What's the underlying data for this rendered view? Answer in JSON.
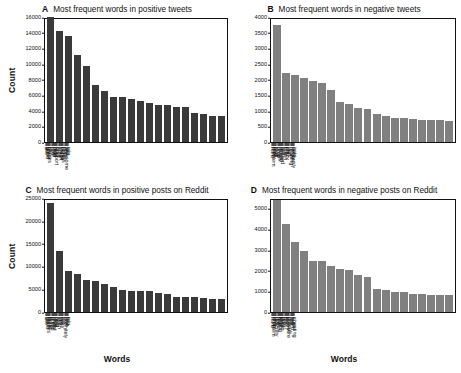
{
  "figure": {
    "background": "#ffffff",
    "dark_bar_color": "#3a3a3a",
    "light_bar_color": "#808080",
    "axis_color": "#111111"
  },
  "chart_data": [
    {
      "id": "A",
      "letter": "A",
      "type": "bar",
      "title": "Most frequent words in positive tweets",
      "xlabel": "",
      "ylabel": "Count",
      "ylim": [
        0,
        16000
      ],
      "yticks": [
        0,
        2000,
        4000,
        6000,
        8000,
        10000,
        12000,
        14000,
        16000
      ],
      "ytick_labels": [
        "0",
        "2000",
        "4000",
        "6000",
        "8000",
        "10000",
        "12000",
        "14000",
        "16000"
      ],
      "grid": false,
      "legend": "none",
      "bar_color": "#3a3a3a",
      "categories": [
        "like",
        "good",
        "great",
        "thanks",
        "join",
        "fun",
        "love",
        "help",
        "nice",
        "support",
        "best",
        "sure",
        "smart",
        "thank",
        "better",
        "fitness",
        "hope",
        "awesome",
        "yes",
        "win"
      ],
      "values": [
        16300,
        14400,
        13800,
        11300,
        9950,
        7450,
        6600,
        5900,
        5800,
        5600,
        5300,
        5100,
        4850,
        4800,
        4550,
        4500,
        3750,
        3700,
        3400,
        3350
      ]
    },
    {
      "id": "B",
      "letter": "B",
      "type": "bar",
      "title": "Most frequent words in negative tweets",
      "xlabel": "",
      "ylabel": "",
      "ylim": [
        0,
        4000
      ],
      "yticks": [
        0,
        500,
        1000,
        1500,
        2000,
        2500,
        3000,
        3500,
        4000
      ],
      "ytick_labels": [
        "0",
        "500",
        "1000",
        "1500",
        "2000",
        "2500",
        "3000",
        "3500",
        "4000"
      ],
      "grid": false,
      "legend": "none",
      "bar_color": "#808080",
      "categories": [
        "hard",
        "problem",
        "pain",
        "bad",
        "stop",
        "drop",
        "tough",
        "miss",
        "wrong",
        "missed",
        "lost",
        "crash",
        "pay",
        "crazy",
        "low",
        "hurt",
        "missing",
        "forget",
        "seriously",
        "hate"
      ],
      "values": [
        3820,
        2250,
        2170,
        2075,
        1990,
        1935,
        1690,
        1310,
        1240,
        1120,
        1060,
        910,
        830,
        790,
        765,
        760,
        720,
        710,
        700,
        695
      ]
    },
    {
      "id": "C",
      "letter": "C",
      "type": "bar",
      "title": "Most frequent words in positive posts on Reddit",
      "xlabel": "Words",
      "ylabel": "Count",
      "ylim": [
        0,
        25000
      ],
      "yticks": [
        0,
        5000,
        10000,
        15000,
        20000,
        25000
      ],
      "ytick_labels": [
        "0",
        "5000",
        "10000",
        "15000",
        "20000",
        "25000"
      ],
      "grid": false,
      "legend": "none",
      "bar_color": "#3a3a3a",
      "categories": [
        "like",
        "good",
        "thanks",
        "sure",
        "better",
        "great",
        "pretty",
        "smart",
        "nice",
        "best",
        "help",
        "yeah",
        "fan",
        "yes",
        "easy",
        "fun",
        "definitely",
        "love",
        "free",
        "win"
      ],
      "values": [
        24300,
        13550,
        9100,
        8400,
        7250,
        6900,
        6300,
        5650,
        4950,
        4750,
        4700,
        4600,
        4200,
        4050,
        3450,
        3400,
        3400,
        3100,
        3000,
        2980
      ]
    },
    {
      "id": "D",
      "letter": "D",
      "type": "bar",
      "title": "Most frequent words in negative posts on Reddit",
      "xlabel": "Words",
      "ylabel": "",
      "ylim": [
        0,
        5500
      ],
      "yticks": [
        0,
        1000,
        2000,
        3000,
        4000,
        5000
      ],
      "ytick_labels": [
        "0",
        "1000",
        "2000",
        "3000",
        "4000",
        "5000"
      ],
      "grid": false,
      "legend": "none",
      "bar_color": "#808080",
      "categories": [
        "hard",
        "problem",
        "drop",
        "law",
        "difficulty",
        "fewer",
        "bad",
        "wrong",
        "stop",
        "dumb",
        "pain",
        "pay",
        "loss",
        "worry",
        "pressure",
        "difficult",
        "lost",
        "weird",
        "suck",
        "cheating"
      ],
      "values": [
        5480,
        4320,
        3460,
        2980,
        2510,
        2490,
        2260,
        2090,
        2080,
        1840,
        1720,
        1130,
        1080,
        1000,
        960,
        890,
        870,
        860,
        850,
        830
      ]
    }
  ]
}
